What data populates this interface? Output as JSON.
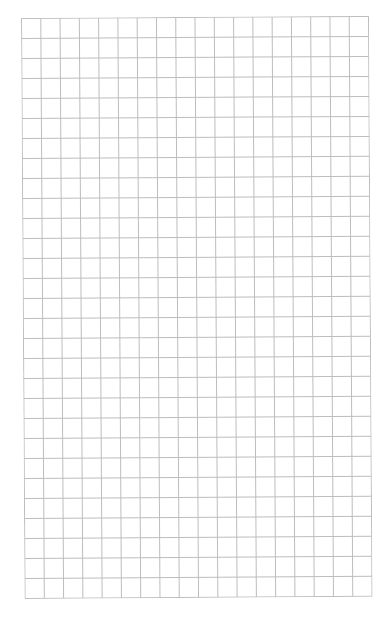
{
  "grid": {
    "columns": 18,
    "rows": 29,
    "line_color": "#bdbdbd",
    "background": "#ffffff"
  }
}
